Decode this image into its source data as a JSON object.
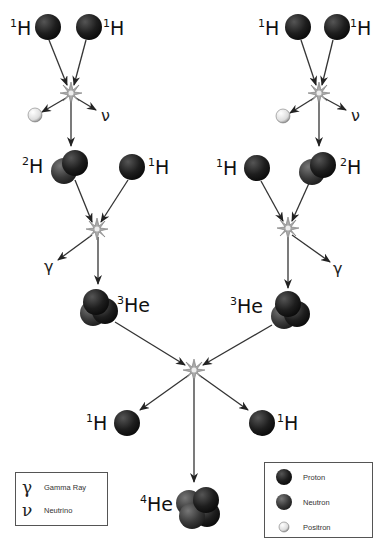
{
  "diagram": {
    "nodes": {
      "h1_top_left_a": {
        "mass": "1",
        "symbol": "H"
      },
      "h1_top_left_b": {
        "mass": "1",
        "symbol": "H"
      },
      "h1_top_right_a": {
        "mass": "1",
        "symbol": "H"
      },
      "h1_top_right_b": {
        "mass": "1",
        "symbol": "H"
      },
      "h2_left": {
        "mass": "2",
        "symbol": "H"
      },
      "h1_mid_left": {
        "mass": "1",
        "symbol": "H"
      },
      "h1_mid_right": {
        "mass": "1",
        "symbol": "H"
      },
      "h2_right": {
        "mass": "2",
        "symbol": "H"
      },
      "he3_left": {
        "mass": "3",
        "symbol": "He"
      },
      "he3_right": {
        "mass": "3",
        "symbol": "He"
      },
      "h1_out_left": {
        "mass": "1",
        "symbol": "H"
      },
      "h1_out_right": {
        "mass": "1",
        "symbol": "H"
      },
      "he4": {
        "mass": "4",
        "symbol": "He"
      }
    },
    "emissions": {
      "nu_left": "ν",
      "nu_right": "ν",
      "gamma_left": "γ",
      "gamma_right": "γ"
    },
    "colors": {
      "proton": "#1a1a1a",
      "neutron": "#3c3c3c",
      "positron": "#eeeeee",
      "arrow": "#333333",
      "star": "#999999"
    }
  },
  "legend_left": {
    "items": [
      {
        "symbol": "γ",
        "label": "Gamma Ray"
      },
      {
        "symbol": "ν",
        "label": "Neutrino"
      }
    ]
  },
  "legend_right": {
    "items": [
      {
        "icon": "proton",
        "label": "Proton"
      },
      {
        "icon": "neutron",
        "label": "Neutron"
      },
      {
        "icon": "positron",
        "label": "Positron"
      }
    ]
  }
}
